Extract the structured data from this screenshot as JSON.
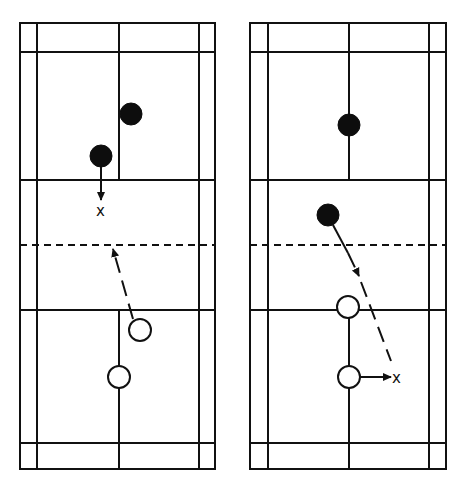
{
  "diagram": {
    "type": "badminton-doubles-court-positions",
    "colors": {
      "line": "#111111",
      "background": "#ffffff",
      "player_filled": "#0d0d0d",
      "player_open": "#ffffff"
    },
    "courts": [
      {
        "id": "left",
        "bounds": {
          "x1": 20,
          "x2": 215,
          "y1": 23,
          "y2": 469
        },
        "side_lines_inner": [
          37,
          199
        ],
        "center_x": 119,
        "lines_y": {
          "back_service_top": 52,
          "short_service_top": 180,
          "net": 245,
          "short_service_bottom": 310,
          "back_service_bottom": 443
        },
        "filled_players": [
          {
            "x": 131,
            "y": 114
          },
          {
            "x": 101,
            "y": 156
          }
        ],
        "open_players": [
          {
            "x": 140,
            "y": 330
          },
          {
            "x": 119,
            "y": 377
          }
        ],
        "target_marks": [
          {
            "x": 101,
            "y": 211,
            "label": "x"
          }
        ]
      },
      {
        "id": "right",
        "bounds": {
          "x1": 250,
          "x2": 446,
          "y1": 23,
          "y2": 469
        },
        "side_lines_inner": [
          268,
          429
        ],
        "center_x": 349,
        "lines_y": {
          "back_service_top": 52,
          "short_service_top": 180,
          "net": 245,
          "short_service_bottom": 310,
          "back_service_bottom": 443
        },
        "filled_players": [
          {
            "x": 349,
            "y": 125
          },
          {
            "x": 328,
            "y": 215
          }
        ],
        "open_players": [
          {
            "x": 348,
            "y": 307
          },
          {
            "x": 349,
            "y": 377
          }
        ],
        "target_marks": [
          {
            "x": 399,
            "y": 377,
            "label": "x"
          }
        ]
      }
    ]
  },
  "labels": {
    "left_target": "x",
    "right_target": "x"
  }
}
